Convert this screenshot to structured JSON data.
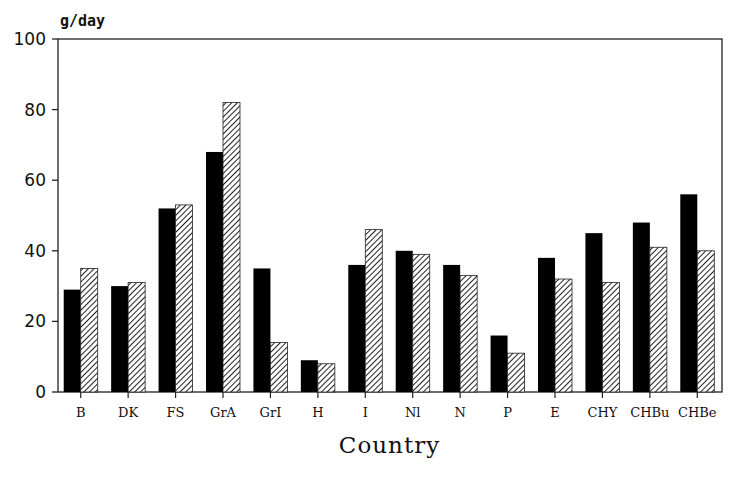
{
  "chart_data": {
    "type": "bar",
    "title": "",
    "ylabel": "g/day",
    "xlabel": "Country",
    "ylim": [
      0,
      100
    ],
    "yticks": [
      0,
      20,
      40,
      60,
      80,
      100
    ],
    "grid": false,
    "legend": null,
    "categories": [
      "B",
      "DK",
      "FS",
      "GrA",
      "GrI",
      "H",
      "I",
      "Nl",
      "N",
      "P",
      "E",
      "CHY",
      "CHBu",
      "CHBe"
    ],
    "series": [
      {
        "name": "solid (black)",
        "style": "solid",
        "color": "#000000",
        "values": [
          29,
          30,
          52,
          68,
          35,
          9,
          36,
          40,
          36,
          16,
          38,
          45,
          48,
          56
        ]
      },
      {
        "name": "hatched",
        "style": "hatched",
        "color": "#555555",
        "values": [
          35,
          31,
          53,
          82,
          14,
          8,
          46,
          39,
          33,
          11,
          32,
          31,
          41,
          40
        ]
      }
    ]
  }
}
